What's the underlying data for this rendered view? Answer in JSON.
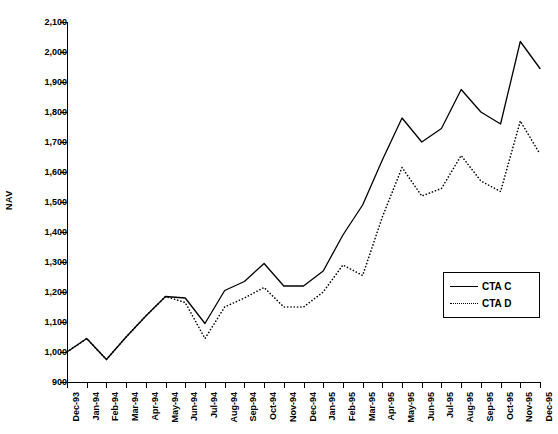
{
  "chart_data": {
    "type": "line",
    "title": "",
    "xlabel": "",
    "ylabel": "NAV",
    "ylim": [
      900,
      2100
    ],
    "ytick_step": 100,
    "grid": false,
    "legend_position": "bottom-right",
    "categories": [
      "Dec-93",
      "Jan-94",
      "Feb-94",
      "Mar-94",
      "Apr-94",
      "May-94",
      "Jun-94",
      "Jul-94",
      "Aug-94",
      "Sep-94",
      "Oct-94",
      "Nov-94",
      "Dec-94",
      "Jan-95",
      "Feb-95",
      "Mar-95",
      "Apr-95",
      "May-95",
      "Jun-95",
      "Jul-95",
      "Aug-95",
      "Sep-95",
      "Oct-95",
      "Nov-95",
      "Dec-95"
    ],
    "ytick_labels": [
      "900",
      "1,000",
      "1,100",
      "1,200",
      "1,300",
      "1,400",
      "1,500",
      "1,600",
      "1,700",
      "1,800",
      "1,900",
      "2,000",
      "2,100"
    ],
    "series": [
      {
        "name": "CTA C",
        "style": "solid",
        "color": "#000000",
        "values": [
          1000,
          1045,
          975,
          1050,
          1120,
          1185,
          1180,
          1095,
          1205,
          1235,
          1295,
          1220,
          1220,
          1270,
          1390,
          1490,
          1640,
          1780,
          1700,
          1745,
          1875,
          1800,
          1760,
          2035,
          1945
        ]
      },
      {
        "name": "CTA D",
        "style": "dotted",
        "color": "#000000",
        "values": [
          1000,
          1045,
          975,
          1050,
          1120,
          1185,
          1165,
          1045,
          1150,
          1180,
          1215,
          1150,
          1150,
          1200,
          1290,
          1255,
          1450,
          1615,
          1520,
          1545,
          1655,
          1570,
          1535,
          1770,
          1660
        ]
      }
    ]
  },
  "legend": {
    "items": [
      {
        "label": "CTA C",
        "style": "solid"
      },
      {
        "label": "CTA D",
        "style": "dotted"
      }
    ]
  }
}
